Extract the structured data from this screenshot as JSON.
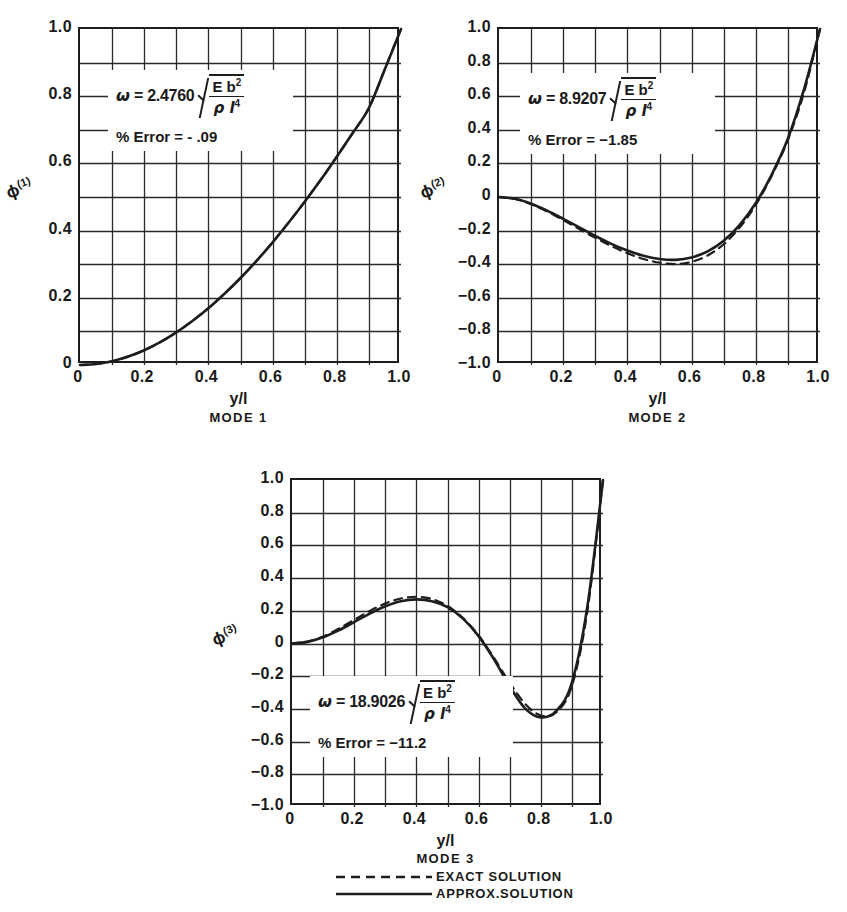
{
  "figure": {
    "legend": {
      "exact_label": "EXACT SOLUTION",
      "approx_label": "APPROX.SOLUTION",
      "exact_style": "dashed",
      "approx_style": "solid"
    },
    "line_color": "#1d1d1d",
    "grid_color": "#2a2a2a"
  },
  "panels": [
    {
      "id": "mode1",
      "ylabel": "ϕ",
      "ylabel_sup": "(1)",
      "xlabel": "y/l",
      "mode_label": "MODE  1",
      "omega_symbol": "ω",
      "equals": "=",
      "coefficient": "2.4760",
      "numerator": "E b",
      "numerator_sup": "2",
      "denominator": "ρ l",
      "denominator_sup": "4",
      "error_text": "% Error = - .09",
      "yticks": [
        "1.0",
        "0.8",
        "0.6",
        "0.4",
        "0.2",
        "0"
      ],
      "ytick_values": [
        1.0,
        0.8,
        0.6,
        0.4,
        0.2,
        0.0
      ],
      "xticks": [
        "0",
        "0.2",
        "0.4",
        "0.6",
        "0.8",
        "1.0"
      ],
      "xtick_values": [
        0.0,
        0.2,
        0.4,
        0.6,
        0.8,
        1.0
      ],
      "ylim": [
        0.0,
        1.0
      ],
      "xlim": [
        0.0,
        1.0
      ],
      "grid_cols": 10,
      "grid_rows": 10
    },
    {
      "id": "mode2",
      "ylabel": "ϕ",
      "ylabel_sup": "(2)",
      "xlabel": "y/l",
      "mode_label": "MODE  2",
      "omega_symbol": "ω",
      "equals": "=",
      "coefficient": "8.9207",
      "numerator": "E b",
      "numerator_sup": "2",
      "denominator": "ρ l",
      "denominator_sup": "4",
      "error_text": "% Error = −1.85",
      "yticks": [
        "1.0",
        "0.8",
        "0.6",
        "0.4",
        "0.2",
        "0",
        "−0.2",
        "−0.4",
        "−0.6",
        "−0.8",
        "−1.0"
      ],
      "ytick_values": [
        1.0,
        0.8,
        0.6,
        0.4,
        0.2,
        0.0,
        -0.2,
        -0.4,
        -0.6,
        -0.8,
        -1.0
      ],
      "xticks": [
        "0",
        "0.2",
        "0.4",
        "0.6",
        "0.8",
        "1.0"
      ],
      "xtick_values": [
        0.0,
        0.2,
        0.4,
        0.6,
        0.8,
        1.0
      ],
      "ylim": [
        -1.0,
        1.0
      ],
      "xlim": [
        0.0,
        1.0
      ],
      "grid_cols": 10,
      "grid_rows": 10
    },
    {
      "id": "mode3",
      "ylabel": "ϕ",
      "ylabel_sup": "(3)",
      "xlabel": "y/l",
      "mode_label": "MODE  3",
      "omega_symbol": "ω",
      "equals": "=",
      "coefficient": "18.9026",
      "numerator": "E b",
      "numerator_sup": "2",
      "denominator": "ρ l",
      "denominator_sup": "4",
      "error_text": "% Error = −11.2",
      "yticks": [
        "1.0",
        "0.8",
        "0.6",
        "0.4",
        "0.2",
        "0",
        "−0.2",
        "−0.4",
        "−0.6",
        "−0.8",
        "−1.0"
      ],
      "ytick_values": [
        1.0,
        0.8,
        0.6,
        0.4,
        0.2,
        0.0,
        -0.2,
        -0.4,
        -0.6,
        -0.8,
        -1.0
      ],
      "xticks": [
        "0",
        "0.2",
        "0.4",
        "0.6",
        "0.8",
        "1.0"
      ],
      "xtick_values": [
        0.0,
        0.2,
        0.4,
        0.6,
        0.8,
        1.0
      ],
      "ylim": [
        -1.0,
        1.0
      ],
      "xlim": [
        0.0,
        1.0
      ],
      "grid_cols": 10,
      "grid_rows": 10
    }
  ],
  "chart_data": [
    {
      "type": "line",
      "title": "MODE 1",
      "xlabel": "y/l",
      "ylabel": "ϕ(1)",
      "xlim": [
        0.0,
        1.0
      ],
      "ylim": [
        0.0,
        1.0
      ],
      "grid": true,
      "legend": [
        "EXACT SOLUTION",
        "APPROX.SOLUTION"
      ],
      "annotation": "ω = 2.4760 √(Eb²/ρl⁴);  % Error = -.09",
      "x": [
        0.0,
        0.05,
        0.1,
        0.15,
        0.2,
        0.25,
        0.3,
        0.35,
        0.4,
        0.45,
        0.5,
        0.55,
        0.6,
        0.65,
        0.7,
        0.75,
        0.8,
        0.85,
        0.9,
        0.95,
        1.0
      ],
      "series": [
        {
          "name": "EXACT SOLUTION",
          "style": "dashed",
          "values": [
            0.0,
            0.003,
            0.011,
            0.025,
            0.044,
            0.068,
            0.097,
            0.131,
            0.169,
            0.212,
            0.259,
            0.31,
            0.365,
            0.424,
            0.486,
            0.551,
            0.62,
            0.691,
            0.765,
            0.881,
            1.0
          ]
        },
        {
          "name": "APPROX.SOLUTION",
          "style": "solid",
          "values": [
            0.0,
            0.003,
            0.011,
            0.025,
            0.044,
            0.068,
            0.097,
            0.131,
            0.169,
            0.212,
            0.259,
            0.31,
            0.365,
            0.424,
            0.486,
            0.551,
            0.62,
            0.691,
            0.765,
            0.881,
            1.0
          ]
        }
      ]
    },
    {
      "type": "line",
      "title": "MODE 2",
      "xlabel": "y/l",
      "ylabel": "ϕ(2)",
      "xlim": [
        0.0,
        1.0
      ],
      "ylim": [
        -1.0,
        1.0
      ],
      "grid": true,
      "legend": [
        "EXACT SOLUTION",
        "APPROX.SOLUTION"
      ],
      "annotation": "ω = 8.9207 √(Eb²/ρl⁴);  % Error = -1.85",
      "x": [
        0.0,
        0.05,
        0.1,
        0.15,
        0.2,
        0.25,
        0.3,
        0.35,
        0.4,
        0.45,
        0.5,
        0.55,
        0.6,
        0.65,
        0.7,
        0.75,
        0.8,
        0.85,
        0.9,
        0.95,
        1.0
      ],
      "series": [
        {
          "name": "EXACT SOLUTION",
          "style": "dashed",
          "values": [
            0.0,
            -0.012,
            -0.043,
            -0.086,
            -0.137,
            -0.19,
            -0.243,
            -0.292,
            -0.335,
            -0.369,
            -0.391,
            -0.399,
            -0.386,
            -0.348,
            -0.281,
            -0.181,
            -0.046,
            0.128,
            0.34,
            0.62,
            1.0
          ]
        },
        {
          "name": "APPROX.SOLUTION",
          "style": "solid",
          "values": [
            0.0,
            -0.011,
            -0.04,
            -0.081,
            -0.13,
            -0.181,
            -0.232,
            -0.279,
            -0.319,
            -0.35,
            -0.369,
            -0.374,
            -0.36,
            -0.324,
            -0.261,
            -0.166,
            -0.036,
            0.135,
            0.348,
            0.64,
            1.0
          ]
        }
      ]
    },
    {
      "type": "line",
      "title": "MODE 3",
      "xlabel": "y/l",
      "ylabel": "ϕ(3)",
      "xlim": [
        0.0,
        1.0
      ],
      "ylim": [
        -1.0,
        1.0
      ],
      "grid": true,
      "legend": [
        "EXACT SOLUTION",
        "APPROX.SOLUTION"
      ],
      "annotation": "ω = 18.9026 √(Eb²/ρl⁴);  % Error = -11.2",
      "x": [
        0.0,
        0.05,
        0.1,
        0.15,
        0.2,
        0.25,
        0.3,
        0.35,
        0.4,
        0.45,
        0.5,
        0.55,
        0.6,
        0.65,
        0.7,
        0.75,
        0.8,
        0.85,
        0.9,
        0.95,
        1.0
      ],
      "series": [
        {
          "name": "EXACT SOLUTION",
          "style": "dashed",
          "values": [
            0.0,
            0.012,
            0.043,
            0.09,
            0.145,
            0.199,
            0.245,
            0.275,
            0.286,
            0.272,
            0.23,
            0.155,
            0.05,
            -0.09,
            -0.24,
            -0.37,
            -0.44,
            -0.42,
            -0.26,
            0.2,
            1.0
          ]
        },
        {
          "name": "APPROX.SOLUTION",
          "style": "solid",
          "values": [
            0.0,
            0.01,
            0.038,
            0.08,
            0.131,
            0.183,
            0.228,
            0.259,
            0.27,
            0.259,
            0.222,
            0.152,
            0.045,
            -0.098,
            -0.262,
            -0.398,
            -0.452,
            -0.412,
            -0.24,
            0.23,
            1.0
          ]
        }
      ]
    }
  ]
}
